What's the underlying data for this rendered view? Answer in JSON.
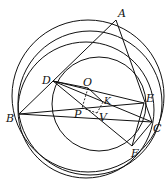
{
  "figure": {
    "stroke_color": "#111111",
    "background": "#ffffff"
  },
  "points": {
    "A": {
      "label": "A",
      "x": 116,
      "y": 20
    },
    "B": {
      "label": "B",
      "x": 19,
      "y": 114
    },
    "C": {
      "label": "C",
      "x": 152,
      "y": 122
    },
    "D": {
      "label": "D",
      "x": 53,
      "y": 81
    },
    "E": {
      "label": "E",
      "x": 144,
      "y": 103
    },
    "F": {
      "label": "F",
      "x": 132,
      "y": 146
    },
    "O": {
      "label": "O",
      "x": 88,
      "y": 88
    },
    "K": {
      "label": "K",
      "x": 103,
      "y": 102
    },
    "P": {
      "label": "P",
      "x": 82,
      "y": 108
    },
    "V": {
      "label": "V",
      "x": 97,
      "y": 113
    }
  },
  "labels": {
    "A": "A",
    "B": "B",
    "C": "C",
    "D": "D",
    "E": "E",
    "F": "F",
    "O": "O",
    "K": "K",
    "P": "P",
    "V": "V"
  },
  "circles": [
    {
      "name": "circumcircle-ABC",
      "cx": 88,
      "cy": 96,
      "r": 76
    },
    {
      "name": "circle-B-F-1",
      "cx": 86,
      "cy": 110,
      "r": 68
    },
    {
      "name": "circle-B-F-2",
      "cx": 90,
      "cy": 103,
      "r": 72
    },
    {
      "name": "circle-DEF",
      "cx": 99,
      "cy": 104,
      "r": 47
    }
  ],
  "segments": [
    [
      "A",
      "B"
    ],
    [
      "A",
      "C"
    ],
    [
      "B",
      "C"
    ],
    [
      "B",
      "E"
    ],
    [
      "D",
      "E"
    ],
    [
      "D",
      "C"
    ],
    [
      "D",
      "F"
    ],
    [
      "E",
      "F"
    ],
    [
      "C",
      "F"
    ],
    [
      "O",
      "K"
    ],
    [
      "D",
      "O"
    ]
  ],
  "dashed_segments": [
    [
      "O",
      "P"
    ],
    [
      "P",
      "V"
    ],
    [
      "K",
      "V"
    ]
  ]
}
